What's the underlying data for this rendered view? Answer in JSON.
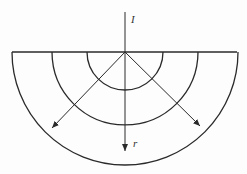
{
  "diagram": {
    "title": "",
    "labels": {
      "current": "I",
      "radius": "r"
    },
    "geometry": {
      "center": [
        125,
        52
      ],
      "surface_line": {
        "x1": 12,
        "x2": 237,
        "y": 52
      },
      "arc_radii": [
        38,
        73,
        113
      ],
      "current_line": {
        "x": 125,
        "y_top": 12
      },
      "arrows": [
        {
          "name": "arrow-down-left",
          "tip": [
            52,
            128
          ]
        },
        {
          "name": "arrow-down",
          "tip": [
            125,
            151
          ]
        },
        {
          "name": "arrow-down-right",
          "tip": [
            200,
            126
          ]
        }
      ]
    },
    "colors": {
      "stroke": "#2a2a2a",
      "background": "#fdfdfd"
    }
  }
}
